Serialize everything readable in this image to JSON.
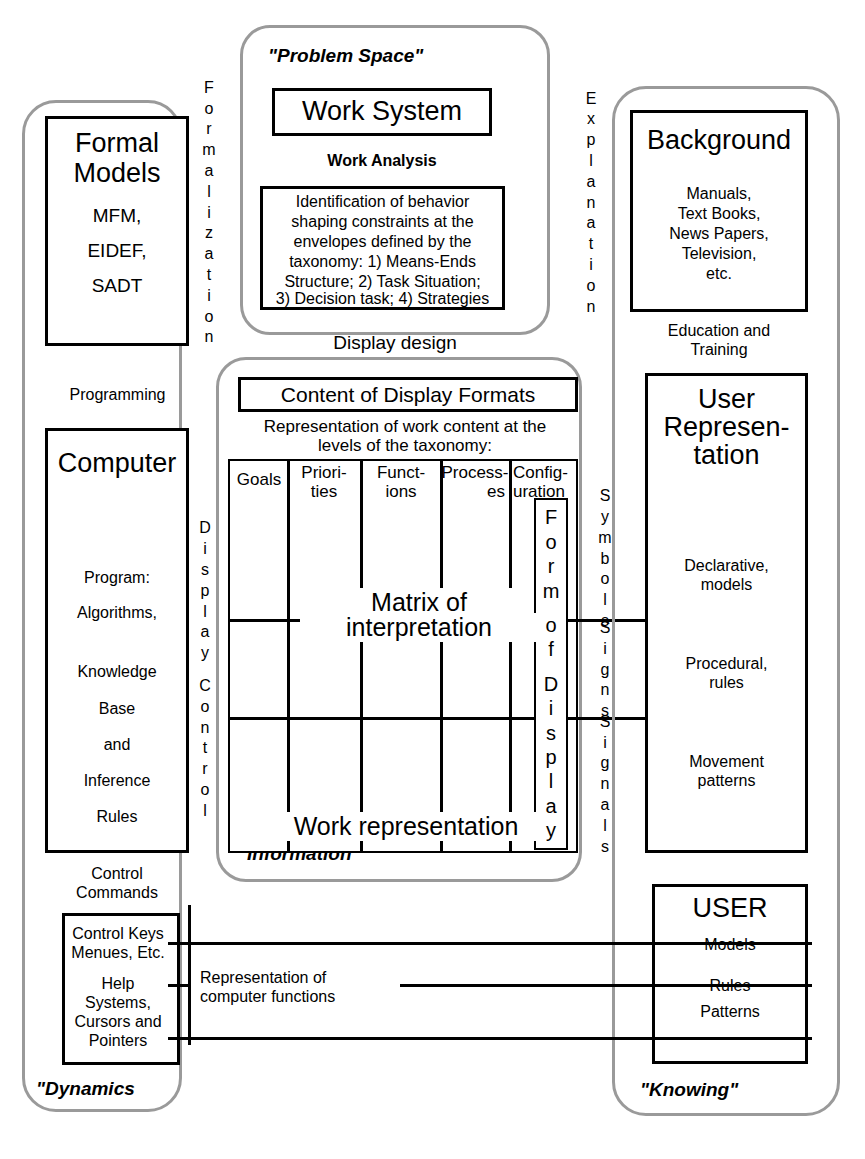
{
  "diagram": {
    "colors": {
      "ink": "#000000",
      "envelope": "#9a9a9a",
      "paper": "#ffffff"
    }
  },
  "left_panel": {
    "caption": "\"Dynamics",
    "formal_models": {
      "title_line1": "Formal",
      "title_line2": "Models",
      "items": [
        "MFM,",
        "EIDEF,",
        "SADT"
      ]
    },
    "between_label": "Programming",
    "computer": {
      "title": "Computer",
      "lines": [
        "Program:",
        "Algorithms,",
        "Knowledge",
        "Base",
        "and",
        "Inference",
        "Rules"
      ]
    },
    "control_commands": "Control\nCommands",
    "control_commands_l1": "Control",
    "control_commands_l2": "Commands",
    "interface_box": {
      "group1_l1": "Control Keys",
      "group1_l2": "Menues, Etc.",
      "group2_l1": "Help",
      "group2_l2": "Systems,",
      "group2_l3": "Cursors and",
      "group2_l4": "Pointers"
    }
  },
  "center_top": {
    "caption": "\"Problem Space\"",
    "work_system": "Work System",
    "work_analysis": "Work Analysis",
    "identification": "Identification of behavior shaping constraints at the envelopes defined by the taxonomy: 1) Means-Ends Structure; 2) Task Situation; 3) Decision task; 4) Strategies",
    "identification_lines": [
      "Identification of behavior",
      "shaping constraints at the",
      "envelopes defined by the",
      "taxonomy: 1) Means-Ends",
      "Structure; 2) Task Situation;",
      "3) Decision task; 4) Strategies"
    ],
    "below_label": "Display design"
  },
  "center_matrix": {
    "caption": "\"Information\"",
    "header": "Content of Display Formats",
    "subtitle_l1": "Representation of work content  at the",
    "subtitle_l2": "levels of the taxonomy:",
    "columns": [
      {
        "l1": "Goals",
        "l2": ""
      },
      {
        "l1": "Priori-",
        "l2": "ties"
      },
      {
        "l1": "Funct-",
        "l2": "ions"
      },
      {
        "l1": "Process-",
        "l2": "es"
      },
      {
        "l1": "Config-",
        "l2": "uration"
      }
    ],
    "center_label_l1": "Matrix of",
    "center_label_l2": "interpretation",
    "bottom_label": "Work representation",
    "form_of_display": "Form of Display",
    "form_of_display_chars": [
      "F",
      "o",
      "r",
      "m",
      "",
      "o",
      "f",
      "",
      "D",
      "i",
      "s",
      "p",
      "l",
      "a",
      "y"
    ]
  },
  "connectors": {
    "formalization": "Formalization",
    "formalization_chars": [
      "F",
      "o",
      "r",
      "m",
      "a",
      "l",
      "i",
      "z",
      "a",
      "t",
      "i",
      "o",
      "n"
    ],
    "explanation": "Explanation",
    "explanation_chars": [
      "E",
      "x",
      "p",
      "l",
      "a",
      "n",
      "a",
      "t",
      "i",
      "o",
      "n"
    ],
    "display_control": "Display Control",
    "display_control_chars": [
      "D",
      "i",
      "s",
      "p",
      "l",
      "a",
      "y",
      "",
      "C",
      "o",
      "n",
      "t",
      "r",
      "o",
      "l"
    ],
    "symbols": "Symbols",
    "symbols_chars": [
      "S",
      "y",
      "m",
      "b",
      "o",
      "l",
      "s"
    ],
    "signs": "Signs",
    "signs_chars": [
      "S",
      "i",
      "g",
      "n",
      "s"
    ],
    "signals": "Signals",
    "signals_chars": [
      "S",
      "i",
      "g",
      "n",
      "a",
      "l",
      "s"
    ],
    "representation_l1": "Representation of",
    "representation_l2": "computer functions"
  },
  "right_panel": {
    "caption": "\"Knowing\"",
    "background": {
      "title": "Background",
      "lines": [
        "Manuals,",
        "Text Books,",
        "News Papers,",
        "Television,",
        "etc."
      ]
    },
    "education": {
      "l1": "Education and",
      "l2": "Training"
    },
    "user_representation": {
      "title_l1": "User",
      "title_l2": "Represen-",
      "title_l3": "tation",
      "rows": [
        {
          "l1": "Declarative,",
          "l2": "models"
        },
        {
          "l1": "Procedural,",
          "l2": "rules"
        },
        {
          "l1": "Movement",
          "l2": "patterns"
        }
      ]
    },
    "user": {
      "title": "USER",
      "rows": [
        "Models",
        "Rules",
        "Patterns"
      ]
    }
  }
}
